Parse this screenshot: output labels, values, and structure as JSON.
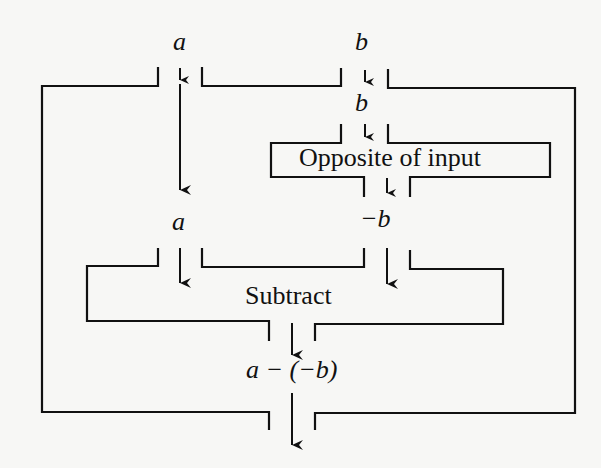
{
  "diagram": {
    "type": "function-machine-flowchart",
    "inputs": {
      "a": "a",
      "b": "b"
    },
    "intermediate": {
      "b_into_opposite": "b",
      "a_into_subtract": "a",
      "neg_b": "−b"
    },
    "boxes": {
      "opposite": "Opposite of input",
      "subtract": "Subtract"
    },
    "output": "a − (−b)",
    "colors": {
      "stroke": "#111111",
      "background": "#f7f7f5"
    }
  }
}
